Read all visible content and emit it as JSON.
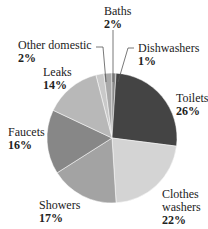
{
  "chart_data": {
    "type": "pie",
    "title": "",
    "start_angle_deg": -14.4,
    "slices": [
      {
        "label": "Other domestic",
        "value": 2,
        "pct": "2%",
        "color": "#c9c9c9"
      },
      {
        "label": "Baths",
        "value": 2,
        "pct": "2%",
        "color": "#a9a9a9"
      },
      {
        "label": "Dishwashers",
        "value": 1,
        "pct": "1%",
        "color": "#8a8a8a"
      },
      {
        "label": "Toilets",
        "value": 26,
        "pct": "26%",
        "color": "#444444"
      },
      {
        "label": "Clothes washers",
        "value": 22,
        "pct": "22%",
        "color": "#d4d4d4"
      },
      {
        "label": "Showers",
        "value": 17,
        "pct": "17%",
        "color": "#a3a3a3"
      },
      {
        "label": "Faucets",
        "value": 16,
        "pct": "16%",
        "color": "#878787"
      },
      {
        "label": "Leaks",
        "value": 14,
        "pct": "14%",
        "color": "#b8b8b8"
      }
    ]
  },
  "labels": {
    "baths": {
      "name": "Baths",
      "pct": "2%"
    },
    "other": {
      "name": "Other domestic",
      "pct": "2%"
    },
    "dish": {
      "name": "Dishwashers",
      "pct": "1%"
    },
    "leaks": {
      "name": "Leaks",
      "pct": "14%"
    },
    "toilets": {
      "name": "Toilets",
      "pct": "26%"
    },
    "faucets": {
      "name": "Faucets",
      "pct": "16%"
    },
    "showers": {
      "name": "Showers",
      "pct": "17%"
    },
    "clothes": {
      "name1": "Clothes",
      "name2": "washers",
      "pct": "22%"
    }
  }
}
